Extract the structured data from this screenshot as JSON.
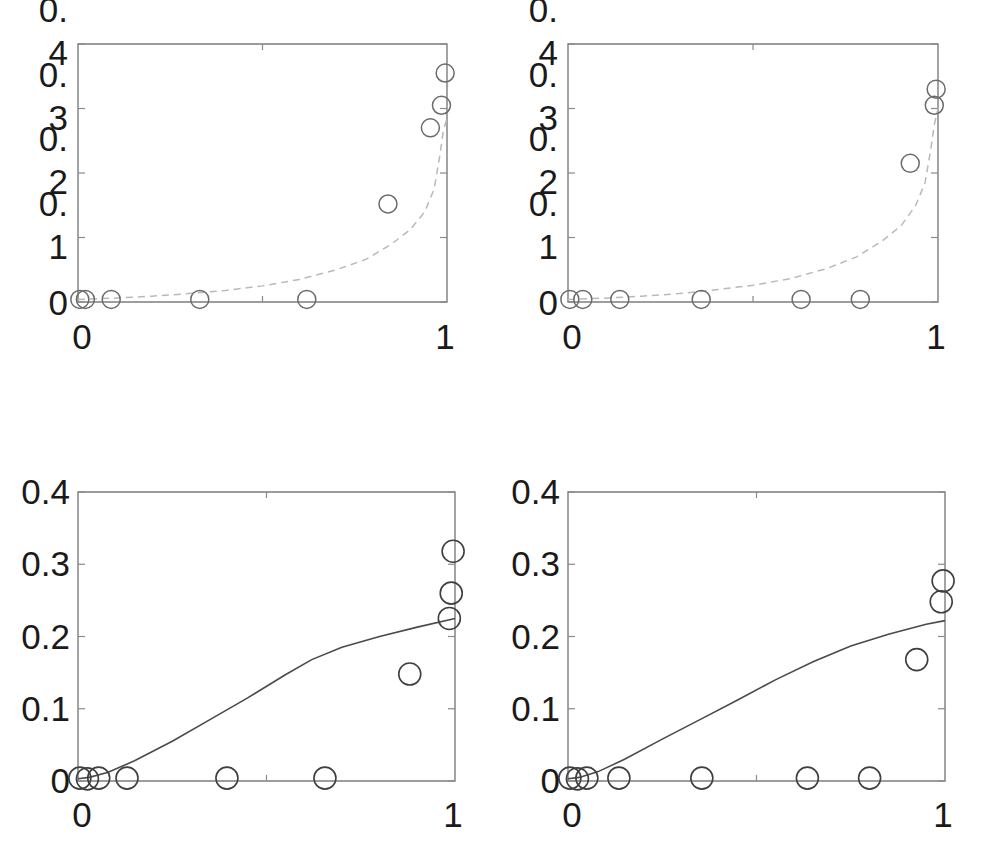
{
  "figure": {
    "background_color": "#ffffff",
    "layout": "2x2 grid of scatter plots with fitted curves",
    "panel_count": 4
  },
  "chart_data": [
    {
      "id": "top-left",
      "type": "scatter",
      "title": "",
      "xlabel": "",
      "ylabel": "",
      "xlim": [
        0,
        1
      ],
      "ylim": [
        0,
        0.4
      ],
      "grid": false,
      "legend": "none",
      "x_tick_labels": [
        "0",
        "1"
      ],
      "x_tick_values": [
        0,
        1
      ],
      "y_tick_labels": [
        "0",
        "0.1",
        "0.2",
        "0.3",
        "0.4"
      ],
      "y_tick_labels_wrapped": [
        [
          "0"
        ],
        [
          "0.",
          "1"
        ],
        [
          "0.",
          "2"
        ],
        [
          "0.",
          "3"
        ],
        [
          "0.",
          "4"
        ]
      ],
      "y_tick_values": [
        0,
        0.1,
        0.2,
        0.3,
        0.4
      ],
      "series": [
        {
          "name": "observed",
          "marker": "open-circle",
          "color": "#6b6b6b",
          "points": [
            {
              "x": 0.005,
              "y": 0.004
            },
            {
              "x": 0.02,
              "y": 0.004
            },
            {
              "x": 0.09,
              "y": 0.004
            },
            {
              "x": 0.33,
              "y": 0.004
            },
            {
              "x": 0.62,
              "y": 0.004
            },
            {
              "x": 0.84,
              "y": 0.152
            },
            {
              "x": 0.955,
              "y": 0.27
            },
            {
              "x": 0.985,
              "y": 0.305
            },
            {
              "x": 0.995,
              "y": 0.355
            }
          ]
        },
        {
          "name": "fitted",
          "marker": "none",
          "linestyle": "dashed",
          "color": "#b9b9b9",
          "x": [
            0.0,
            0.1,
            0.2,
            0.3,
            0.4,
            0.5,
            0.6,
            0.7,
            0.78,
            0.85,
            0.9,
            0.94,
            0.965,
            0.98,
            0.99,
            1.0
          ],
          "y": [
            0.004,
            0.006,
            0.009,
            0.013,
            0.018,
            0.025,
            0.035,
            0.05,
            0.066,
            0.09,
            0.112,
            0.14,
            0.175,
            0.225,
            0.265,
            0.285
          ]
        }
      ]
    },
    {
      "id": "top-right",
      "type": "scatter",
      "title": "",
      "xlabel": "",
      "ylabel": "",
      "xlim": [
        0,
        1
      ],
      "ylim": [
        0,
        0.4
      ],
      "grid": false,
      "legend": "none",
      "x_tick_labels": [
        "0",
        "1"
      ],
      "x_tick_values": [
        0,
        1
      ],
      "y_tick_labels": [
        "0",
        "0.1",
        "0.2",
        "0.3",
        "0.4"
      ],
      "y_tick_labels_wrapped": [
        [
          "0"
        ],
        [
          "0.",
          "1"
        ],
        [
          "0.",
          "2"
        ],
        [
          "0.",
          "3"
        ],
        [
          "0.",
          "4"
        ]
      ],
      "y_tick_values": [
        0,
        0.1,
        0.2,
        0.3,
        0.4
      ],
      "series": [
        {
          "name": "observed",
          "marker": "open-circle",
          "color": "#6b6b6b",
          "points": [
            {
              "x": 0.005,
              "y": 0.004
            },
            {
              "x": 0.04,
              "y": 0.004
            },
            {
              "x": 0.14,
              "y": 0.004
            },
            {
              "x": 0.36,
              "y": 0.004
            },
            {
              "x": 0.63,
              "y": 0.004
            },
            {
              "x": 0.79,
              "y": 0.004
            },
            {
              "x": 0.925,
              "y": 0.215
            },
            {
              "x": 0.99,
              "y": 0.305
            },
            {
              "x": 0.995,
              "y": 0.33
            }
          ]
        },
        {
          "name": "fitted",
          "marker": "none",
          "linestyle": "dashed",
          "color": "#b9b9b9",
          "x": [
            0.0,
            0.1,
            0.2,
            0.3,
            0.4,
            0.5,
            0.6,
            0.7,
            0.78,
            0.85,
            0.9,
            0.94,
            0.965,
            0.98,
            0.99,
            1.0
          ],
          "y": [
            0.004,
            0.006,
            0.009,
            0.013,
            0.019,
            0.026,
            0.036,
            0.052,
            0.07,
            0.095,
            0.118,
            0.15,
            0.185,
            0.235,
            0.275,
            0.3
          ]
        }
      ]
    },
    {
      "id": "bottom-left",
      "type": "scatter",
      "title": "",
      "xlabel": "",
      "ylabel": "",
      "xlim": [
        0,
        1
      ],
      "ylim": [
        0,
        0.4
      ],
      "grid": false,
      "legend": "none",
      "x_tick_labels": [
        "0",
        "1"
      ],
      "x_tick_values": [
        0,
        1
      ],
      "y_tick_labels": [
        "0",
        "0.1",
        "0.2",
        "0.3",
        "0.4"
      ],
      "y_tick_values": [
        0,
        0.1,
        0.2,
        0.3,
        0.4
      ],
      "series": [
        {
          "name": "observed",
          "marker": "open-circle",
          "color": "#3f3f3f",
          "points": [
            {
              "x": 0.005,
              "y": 0.004
            },
            {
              "x": 0.025,
              "y": 0.003
            },
            {
              "x": 0.055,
              "y": 0.004
            },
            {
              "x": 0.13,
              "y": 0.004
            },
            {
              "x": 0.395,
              "y": 0.004
            },
            {
              "x": 0.655,
              "y": 0.004
            },
            {
              "x": 0.88,
              "y": 0.148
            },
            {
              "x": 0.985,
              "y": 0.225
            },
            {
              "x": 0.99,
              "y": 0.26
            },
            {
              "x": 0.995,
              "y": 0.318
            }
          ]
        },
        {
          "name": "fitted",
          "marker": "none",
          "linestyle": "solid",
          "color": "#4a4a4a",
          "x": [
            0.0,
            0.03,
            0.08,
            0.15,
            0.25,
            0.35,
            0.45,
            0.55,
            0.62,
            0.7,
            0.8,
            0.9,
            1.0
          ],
          "y": [
            0.003,
            0.005,
            0.012,
            0.028,
            0.055,
            0.085,
            0.115,
            0.147,
            0.168,
            0.185,
            0.2,
            0.213,
            0.225
          ]
        }
      ]
    },
    {
      "id": "bottom-right",
      "type": "scatter",
      "title": "",
      "xlabel": "",
      "ylabel": "",
      "xlim": [
        0,
        1
      ],
      "ylim": [
        0,
        0.4
      ],
      "grid": false,
      "legend": "none",
      "x_tick_labels": [
        "0",
        "1"
      ],
      "x_tick_values": [
        0,
        1
      ],
      "y_tick_labels": [
        "0",
        "0.1",
        "0.2",
        "0.3",
        "0.4"
      ],
      "y_tick_values": [
        0,
        0.1,
        0.2,
        0.3,
        0.4
      ],
      "series": [
        {
          "name": "observed",
          "marker": "open-circle",
          "color": "#3f3f3f",
          "points": [
            {
              "x": 0.005,
              "y": 0.004
            },
            {
              "x": 0.025,
              "y": 0.003
            },
            {
              "x": 0.05,
              "y": 0.004
            },
            {
              "x": 0.135,
              "y": 0.004
            },
            {
              "x": 0.355,
              "y": 0.004
            },
            {
              "x": 0.635,
              "y": 0.004
            },
            {
              "x": 0.8,
              "y": 0.004
            },
            {
              "x": 0.925,
              "y": 0.168
            },
            {
              "x": 0.99,
              "y": 0.248
            },
            {
              "x": 0.995,
              "y": 0.277
            }
          ]
        },
        {
          "name": "fitted",
          "marker": "none",
          "linestyle": "solid",
          "color": "#4a4a4a",
          "x": [
            0.0,
            0.03,
            0.08,
            0.15,
            0.25,
            0.35,
            0.45,
            0.55,
            0.65,
            0.75,
            0.85,
            0.95,
            1.0
          ],
          "y": [
            0.003,
            0.005,
            0.013,
            0.03,
            0.058,
            0.085,
            0.112,
            0.14,
            0.165,
            0.187,
            0.203,
            0.217,
            0.222
          ]
        }
      ]
    }
  ]
}
